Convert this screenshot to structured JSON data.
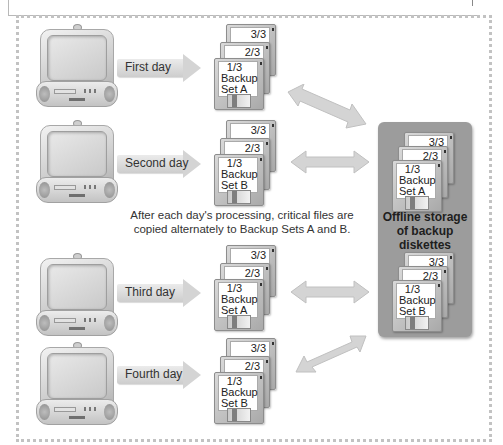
{
  "days": [
    {
      "label": "First day",
      "set": "A"
    },
    {
      "label": "Second day",
      "set": "B"
    },
    {
      "label": "Third day",
      "set": "A"
    },
    {
      "label": "Fourth day",
      "set": "B"
    }
  ],
  "disks": {
    "back_label": "3/3",
    "middle_label": "2/3",
    "front_number": "1/3",
    "front_line1": "Backup",
    "set_a": "Set A",
    "set_b": "Set B"
  },
  "caption": "After each day's processing, critical files are copied alternately to Backup Sets A and B.",
  "storage": {
    "title": "Offline storage of backup diskettes",
    "sets": [
      "Set A",
      "Set B"
    ]
  },
  "colors": {
    "storage_bg": "#9c9c9c",
    "arrow_fill": "#d4d4d4",
    "frame_dots": "#c2c2c2"
  }
}
